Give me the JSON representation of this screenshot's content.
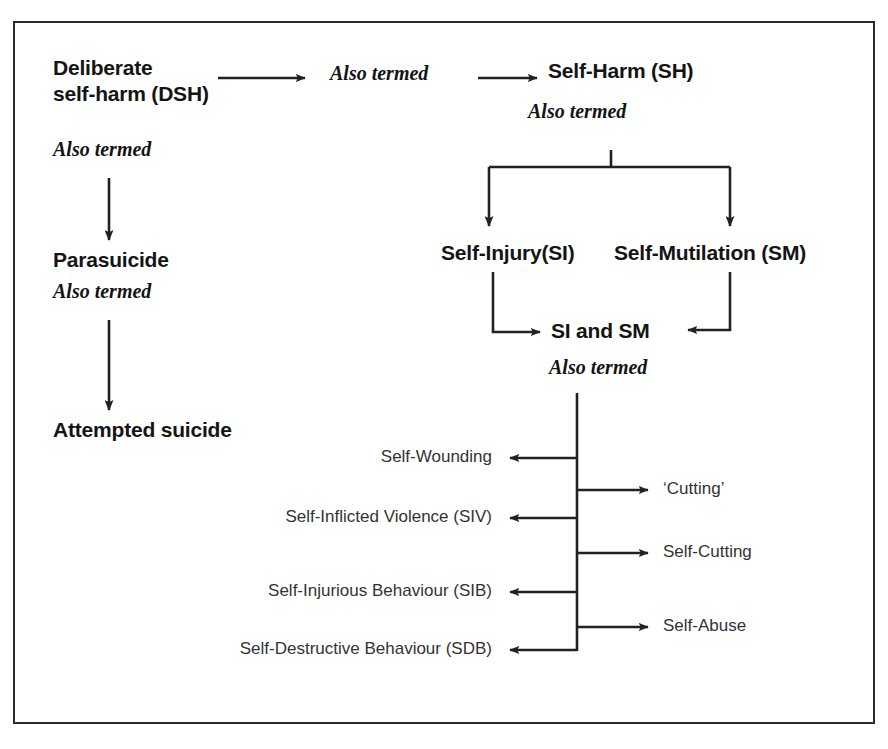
{
  "figure": {
    "type": "flowchart",
    "border_color": "#2b2b2b",
    "text_color": "#141414",
    "connector_color": "#222222"
  },
  "nodes": {
    "dsh": "Deliberate\nself-harm (DSH)",
    "parasuicide": "Parasuicide",
    "attempted_suicide": "Attempted suicide",
    "self_harm": "Self-Harm (SH)",
    "self_injury": "Self-Injury(SI)",
    "self_mutilation": "Self-Mutilation (SM)",
    "si_and_sm": "SI and SM"
  },
  "connector_labels": {
    "dsh_to_sh": "Also termed",
    "dsh_to_parasuicide": "Also termed",
    "sh_to_branch": "Also termed",
    "parasuicide_to_attempted": "Also termed",
    "sism_to_terms": "Also termed"
  },
  "terms_left": [
    {
      "label": "Self-Wounding"
    },
    {
      "label": "Self-Inflicted Violence (SIV)"
    },
    {
      "label": "Self-Injurious Behaviour (SIB)"
    },
    {
      "label": "Self-Destructive Behaviour (SDB)"
    }
  ],
  "terms_right": [
    {
      "label": "‘Cutting’"
    },
    {
      "label": "Self-Cutting"
    },
    {
      "label": "Self-Abuse"
    }
  ]
}
